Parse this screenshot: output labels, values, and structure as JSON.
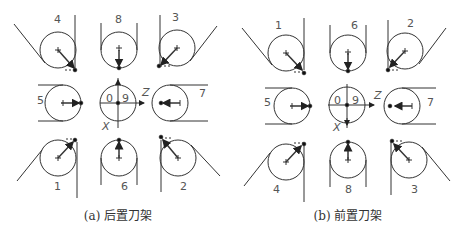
{
  "figure": {
    "panels": [
      {
        "id": "a",
        "caption": "(a) 后置刀架",
        "caption_pos": [
          118,
          213
        ],
        "tools": [
          {
            "label": "4",
            "pos": "top-left"
          },
          {
            "label": "8",
            "pos": "top-center"
          },
          {
            "label": "3",
            "pos": "top-right"
          },
          {
            "label": "5",
            "pos": "middle-left"
          },
          {
            "label": "0",
            "pos": "center-left-half"
          },
          {
            "label": "9",
            "pos": "center-right-half"
          },
          {
            "label": "7",
            "pos": "middle-right"
          },
          {
            "label": "1",
            "pos": "bottom-left"
          },
          {
            "label": "6",
            "pos": "bottom-center"
          },
          {
            "label": "2",
            "pos": "bottom-right"
          }
        ],
        "axes": {
          "z": "Z",
          "x": "X"
        }
      },
      {
        "id": "b",
        "caption": "(b) 前置刀架",
        "caption_pos": [
          348,
          213
        ],
        "tools": [
          {
            "label": "1",
            "pos": "top-left"
          },
          {
            "label": "6",
            "pos": "top-center"
          },
          {
            "label": "2",
            "pos": "top-right"
          },
          {
            "label": "5",
            "pos": "middle-left"
          },
          {
            "label": "0",
            "pos": "center-left-half"
          },
          {
            "label": "9",
            "pos": "center-right-half"
          },
          {
            "label": "7",
            "pos": "middle-right"
          },
          {
            "label": "4",
            "pos": "bottom-left"
          },
          {
            "label": "8",
            "pos": "bottom-center"
          },
          {
            "label": "3",
            "pos": "bottom-right"
          }
        ],
        "axes": {
          "z": "Z",
          "x": "X"
        }
      }
    ],
    "colors": {
      "line": "#333333",
      "text": "#555555",
      "background": "#ffffff"
    }
  }
}
